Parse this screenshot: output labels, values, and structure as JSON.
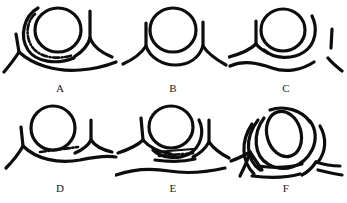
{
  "figure": {
    "title": "",
    "background_color": "#ffffff",
    "stroke_color": "#0d0d0d",
    "panel_count": 6,
    "panels": [
      {
        "id": "A",
        "label": "A",
        "description": "Circle with surrounding thick arc, interrupted dash-dot arc inside, Y-junction branch at right and at left, long lower boundary line"
      },
      {
        "id": "B",
        "label": "B",
        "description": "Circle with thick arc wrapping the lower half, vertical branch lines forming Y-junctions at left and right"
      },
      {
        "id": "C",
        "label": "C",
        "description": "Circle with concentric outer arc, separate lower wavy line, short vertical bar at left, short diagonal bar at right"
      },
      {
        "id": "D",
        "label": "D",
        "description": "Circle resting on a wavy line, short dash-dot segment beneath the circle, Y-junctions at left and right"
      },
      {
        "id": "E",
        "label": "E",
        "description": "Circle with concentric arc, thick dash-dot segment below between parallel lines, lower long wavy line, Y-junctions both sides"
      },
      {
        "id": "F",
        "label": "F",
        "description": "Tilted oval with nested concentric arcs, Y-junction branches converging at lower left and lower right"
      }
    ]
  }
}
